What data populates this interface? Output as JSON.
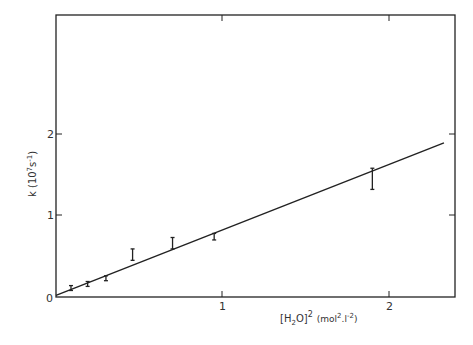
{
  "chart_data": {
    "type": "scatter",
    "title": "",
    "xlabel": "[H2O]^2 (mol^2.l^-2)",
    "ylabel": "k (10^7 s^-1)",
    "xlim": [
      0,
      2.4
    ],
    "ylim": [
      0,
      3.5
    ],
    "x_ticks": [
      0,
      1,
      2
    ],
    "y_ticks": [
      0,
      1,
      2
    ],
    "x_tick_labels": [
      "1",
      "2"
    ],
    "y_tick_labels": [
      "0",
      "1",
      "2"
    ],
    "grid": false,
    "legend": null,
    "series": [
      {
        "name": "measured k",
        "type": "errorbar",
        "x": [
          0.09,
          0.19,
          0.3,
          0.46,
          0.7,
          0.95,
          1.9
        ],
        "y": [
          0.11,
          0.16,
          0.23,
          0.52,
          0.66,
          0.74,
          1.46
        ],
        "y_err_low": [
          0.03,
          0.03,
          0.03,
          0.07,
          0.07,
          0.04,
          0.14
        ],
        "y_err_high": [
          0.03,
          0.03,
          0.03,
          0.07,
          0.07,
          0.04,
          0.12
        ]
      },
      {
        "name": "linear fit",
        "type": "line",
        "x": [
          0,
          2.33
        ],
        "y": [
          0.02,
          1.89
        ]
      }
    ]
  },
  "axes": {
    "origin_label": "0",
    "x_tick_1": "1",
    "x_tick_2": "2",
    "y_tick_1": "1",
    "y_tick_2": "2",
    "ylabel_k": "k",
    "ylabel_unit_pre": "(10",
    "ylabel_exp": "7",
    "ylabel_s": "s",
    "ylabel_sexp": "-1",
    "ylabel_close": ")",
    "xlabel_h": "[H",
    "xlabel_sub": "2",
    "xlabel_o": "O]",
    "xlabel_sq": "2",
    "xlabel_unit_pre": "(mol",
    "xlabel_unit_exp1": "2",
    "xlabel_unit_mid": ".l",
    "xlabel_unit_exp2": "-2",
    "xlabel_unit_close": ")"
  }
}
